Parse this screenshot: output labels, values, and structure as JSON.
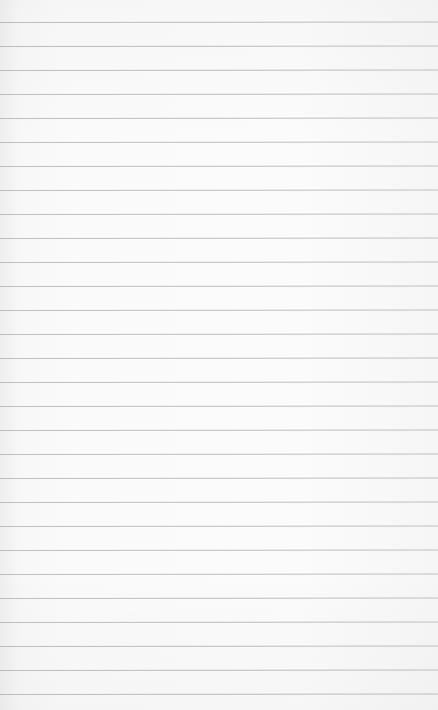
{
  "paper": {
    "background_color": "#fafafa",
    "rule_color": "#bfbfbf",
    "rule_count": 29,
    "first_rule_y": 22,
    "rule_spacing": 24
  }
}
